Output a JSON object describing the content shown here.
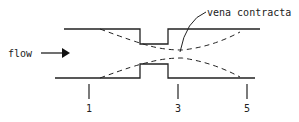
{
  "diagram": {
    "type": "orifice flow contraction",
    "flow_label": "flow",
    "annotation": "vena contracta",
    "stations": [
      {
        "label": "1",
        "x": 89
      },
      {
        "label": "3",
        "x": 178
      },
      {
        "label": "5",
        "x": 247
      }
    ],
    "colors": {
      "line": "#222222",
      "background": "#ffffff"
    }
  }
}
